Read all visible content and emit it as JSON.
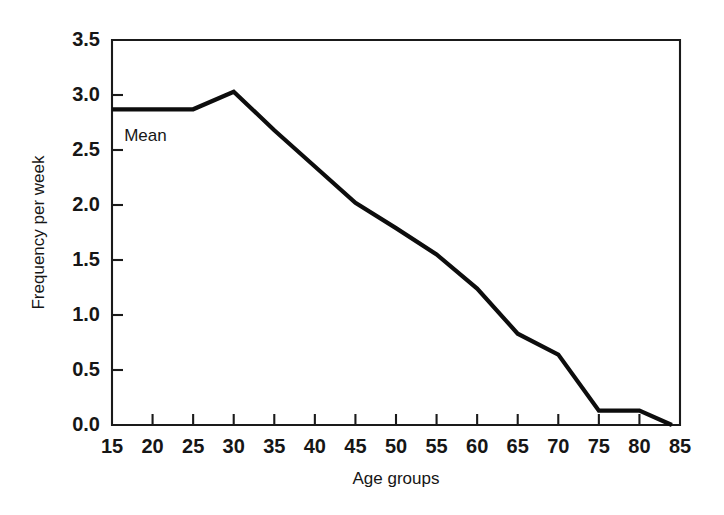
{
  "chart_data": {
    "type": "line",
    "title": "",
    "xlabel": "Age groups",
    "ylabel": "Frequency per week",
    "xlim": [
      15,
      85
    ],
    "ylim": [
      0.0,
      3.5
    ],
    "grid": false,
    "legend": "none",
    "annotations": [
      {
        "text": "Mean",
        "x": 16.5,
        "y": 2.58
      }
    ],
    "xticks": [
      15,
      20,
      25,
      30,
      35,
      40,
      45,
      50,
      55,
      60,
      65,
      70,
      75,
      80,
      85
    ],
    "xtick_labels": [
      "15",
      "20",
      "25",
      "30",
      "35",
      "40",
      "45",
      "50",
      "55",
      "60",
      "65",
      "70",
      "75",
      "80",
      "85"
    ],
    "yticks": [
      0.0,
      0.5,
      1.0,
      1.5,
      2.0,
      2.5,
      3.0,
      3.5
    ],
    "ytick_labels": [
      "0.0",
      "0.5",
      "1.0",
      "1.5",
      "2.0",
      "2.5",
      "3.0",
      "3.5"
    ],
    "series": [
      {
        "name": "Mean",
        "color": "#0d0d0d",
        "x": [
          15,
          25,
          30,
          35,
          40,
          45,
          50,
          55,
          60,
          65,
          70,
          75,
          80,
          84
        ],
        "values": [
          2.87,
          2.87,
          3.03,
          2.68,
          2.35,
          2.02,
          1.79,
          1.55,
          1.24,
          0.83,
          0.64,
          0.13,
          0.13,
          0.0
        ]
      }
    ]
  },
  "colors": {
    "line": "#0d0d0d",
    "axis": "#1a1a1a",
    "text": "#161616",
    "background": "#ffffff"
  }
}
